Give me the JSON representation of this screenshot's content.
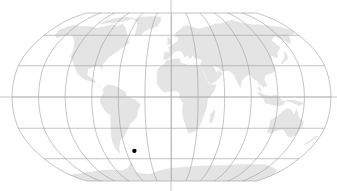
{
  "map": {
    "projection": "Robinson",
    "width": 337,
    "height": 191,
    "center": {
      "x": 171.5,
      "y": 97
    },
    "equator_half_width": 159.5,
    "pole_half_height": 84,
    "graticule": {
      "lon_step_deg": 30,
      "lat_step_deg": 30
    },
    "colors": {
      "background": "#ffffff",
      "land": "#e4e4e4",
      "graticule": "#9a9a9a",
      "axis": "#b8b8b8",
      "marker": "#000000"
    },
    "crosshair": {
      "vertical_x": 171,
      "horizontal_y": 97
    },
    "markers": [
      {
        "name": "location-marker",
        "lon": -49,
        "lat": -52,
        "radius": 2.2
      }
    ]
  },
  "land": [
    {
      "name": "north-america",
      "coords": [
        [
          -168,
          66
        ],
        [
          -162,
          70
        ],
        [
          -156,
          71
        ],
        [
          -140,
          70
        ],
        [
          -128,
          70
        ],
        [
          -115,
          68
        ],
        [
          -95,
          72
        ],
        [
          -85,
          70
        ],
        [
          -80,
          73
        ],
        [
          -70,
          68
        ],
        [
          -62,
          60
        ],
        [
          -56,
          52
        ],
        [
          -66,
          45
        ],
        [
          -70,
          42
        ],
        [
          -76,
          38
        ],
        [
          -81,
          31
        ],
        [
          -81,
          25
        ],
        [
          -84,
          30
        ],
        [
          -90,
          29
        ],
        [
          -97,
          27
        ],
        [
          -97,
          21
        ],
        [
          -92,
          18
        ],
        [
          -88,
          16
        ],
        [
          -83,
          10
        ],
        [
          -78,
          8
        ],
        [
          -80,
          9
        ],
        [
          -86,
          13
        ],
        [
          -92,
          15
        ],
        [
          -98,
          16
        ],
        [
          -105,
          20
        ],
        [
          -110,
          24
        ],
        [
          -114,
          30
        ],
        [
          -118,
          34
        ],
        [
          -123,
          39
        ],
        [
          -124,
          46
        ],
        [
          -130,
          54
        ],
        [
          -140,
          60
        ],
        [
          -150,
          60
        ],
        [
          -158,
          57
        ],
        [
          -165,
          60
        ],
        [
          -168,
          66
        ]
      ]
    },
    {
      "name": "greenland",
      "coords": [
        [
          -52,
          60
        ],
        [
          -44,
          60
        ],
        [
          -38,
          65
        ],
        [
          -22,
          70
        ],
        [
          -18,
          76
        ],
        [
          -20,
          82
        ],
        [
          -35,
          83
        ],
        [
          -55,
          82
        ],
        [
          -68,
          78
        ],
        [
          -58,
          75
        ],
        [
          -54,
          70
        ],
        [
          -52,
          60
        ]
      ]
    },
    {
      "name": "arctic-islands",
      "coords": [
        [
          -120,
          72
        ],
        [
          -95,
          74
        ],
        [
          -80,
          76
        ],
        [
          -65,
          80
        ],
        [
          -85,
          82
        ],
        [
          -110,
          78
        ],
        [
          -120,
          72
        ]
      ]
    },
    {
      "name": "south-america",
      "coords": [
        [
          -78,
          8
        ],
        [
          -72,
          12
        ],
        [
          -62,
          10
        ],
        [
          -52,
          5
        ],
        [
          -50,
          0
        ],
        [
          -40,
          -3
        ],
        [
          -35,
          -7
        ],
        [
          -38,
          -13
        ],
        [
          -40,
          -20
        ],
        [
          -48,
          -26
        ],
        [
          -53,
          -33
        ],
        [
          -58,
          -38
        ],
        [
          -63,
          -41
        ],
        [
          -65,
          -45
        ],
        [
          -68,
          -50
        ],
        [
          -69,
          -55
        ],
        [
          -72,
          -52
        ],
        [
          -74,
          -45
        ],
        [
          -73,
          -37
        ],
        [
          -71,
          -28
        ],
        [
          -70,
          -18
        ],
        [
          -76,
          -13
        ],
        [
          -81,
          -5
        ],
        [
          -80,
          0
        ],
        [
          -77,
          4
        ],
        [
          -78,
          8
        ]
      ]
    },
    {
      "name": "europe-asia",
      "coords": [
        [
          -10,
          36
        ],
        [
          -9,
          43
        ],
        [
          -2,
          44
        ],
        [
          -4,
          48
        ],
        [
          2,
          51
        ],
        [
          8,
          54
        ],
        [
          10,
          58
        ],
        [
          5,
          62
        ],
        [
          14,
          67
        ],
        [
          22,
          70
        ],
        [
          30,
          70
        ],
        [
          40,
          67
        ],
        [
          45,
          68
        ],
        [
          60,
          70
        ],
        [
          70,
          73
        ],
        [
          80,
          73
        ],
        [
          90,
          75
        ],
        [
          105,
          78
        ],
        [
          115,
          74
        ],
        [
          130,
          72
        ],
        [
          140,
          72
        ],
        [
          160,
          70
        ],
        [
          170,
          69
        ],
        [
          180,
          66
        ],
        [
          178,
          62
        ],
        [
          165,
          60
        ],
        [
          162,
          56
        ],
        [
          156,
          51
        ],
        [
          145,
          59
        ],
        [
          135,
          55
        ],
        [
          140,
          48
        ],
        [
          132,
          43
        ],
        [
          128,
          37
        ],
        [
          122,
          40
        ],
        [
          120,
          32
        ],
        [
          122,
          28
        ],
        [
          117,
          23
        ],
        [
          108,
          21
        ],
        [
          106,
          16
        ],
        [
          109,
          11
        ],
        [
          104,
          9
        ],
        [
          100,
          13
        ],
        [
          98,
          8
        ],
        [
          103,
          2
        ],
        [
          98,
          15
        ],
        [
          94,
          17
        ],
        [
          90,
          22
        ],
        [
          86,
          20
        ],
        [
          80,
          15
        ],
        [
          78,
          8
        ],
        [
          73,
          18
        ],
        [
          72,
          21
        ],
        [
          67,
          25
        ],
        [
          58,
          25
        ],
        [
          56,
          27
        ],
        [
          50,
          30
        ],
        [
          48,
          29
        ],
        [
          52,
          24
        ],
        [
          56,
          26
        ],
        [
          59,
          22
        ],
        [
          52,
          16
        ],
        [
          44,
          12
        ],
        [
          43,
          17
        ],
        [
          38,
          24
        ],
        [
          35,
          28
        ],
        [
          34,
          31
        ],
        [
          36,
          36
        ],
        [
          28,
          37
        ],
        [
          26,
          40
        ],
        [
          24,
          38
        ],
        [
          22,
          36
        ],
        [
          20,
          40
        ],
        [
          16,
          38
        ],
        [
          12,
          44
        ],
        [
          8,
          44
        ],
        [
          3,
          43
        ],
        [
          0,
          39
        ],
        [
          -5,
          36
        ],
        [
          -10,
          36
        ]
      ]
    },
    {
      "name": "scandinavia",
      "coords": [
        [
          5,
          58
        ],
        [
          6,
          62
        ],
        [
          12,
          66
        ],
        [
          18,
          70
        ],
        [
          26,
          71
        ],
        [
          30,
          70
        ],
        [
          28,
          66
        ],
        [
          22,
          64
        ],
        [
          18,
          60
        ],
        [
          12,
          56
        ],
        [
          8,
          58
        ],
        [
          5,
          58
        ]
      ]
    },
    {
      "name": "africa",
      "coords": [
        [
          -17,
          21
        ],
        [
          -16,
          27
        ],
        [
          -10,
          31
        ],
        [
          -6,
          35
        ],
        [
          3,
          37
        ],
        [
          10,
          37
        ],
        [
          11,
          33
        ],
        [
          20,
          31
        ],
        [
          30,
          31
        ],
        [
          33,
          31
        ],
        [
          35,
          28
        ],
        [
          39,
          20
        ],
        [
          43,
          12
        ],
        [
          51,
          12
        ],
        [
          48,
          5
        ],
        [
          41,
          -2
        ],
        [
          40,
          -10
        ],
        [
          37,
          -18
        ],
        [
          35,
          -24
        ],
        [
          32,
          -29
        ],
        [
          28,
          -33
        ],
        [
          20,
          -35
        ],
        [
          18,
          -31
        ],
        [
          14,
          -22
        ],
        [
          12,
          -14
        ],
        [
          13,
          -6
        ],
        [
          9,
          -1
        ],
        [
          9,
          4
        ],
        [
          4,
          6
        ],
        [
          -4,
          5
        ],
        [
          -8,
          4
        ],
        [
          -13,
          8
        ],
        [
          -17,
          13
        ],
        [
          -17,
          21
        ]
      ]
    },
    {
      "name": "madagascar",
      "coords": [
        [
          44,
          -25
        ],
        [
          47,
          -25
        ],
        [
          50,
          -15
        ],
        [
          49,
          -12
        ],
        [
          44,
          -17
        ],
        [
          44,
          -25
        ]
      ]
    },
    {
      "name": "arabia",
      "coords": [
        [
          36,
          28
        ],
        [
          39,
          21
        ],
        [
          43,
          13
        ],
        [
          50,
          15
        ],
        [
          56,
          20
        ],
        [
          58,
          23
        ],
        [
          52,
          24
        ],
        [
          50,
          28
        ],
        [
          48,
          30
        ],
        [
          40,
          32
        ],
        [
          36,
          28
        ]
      ]
    },
    {
      "name": "british-isles",
      "coords": [
        [
          -6,
          50
        ],
        [
          1,
          51
        ],
        [
          0,
          54
        ],
        [
          -3,
          58
        ],
        [
          -6,
          58
        ],
        [
          -5,
          54
        ],
        [
          -6,
          50
        ]
      ]
    },
    {
      "name": "japan",
      "coords": [
        [
          130,
          31
        ],
        [
          135,
          34
        ],
        [
          140,
          36
        ],
        [
          142,
          40
        ],
        [
          141,
          45
        ],
        [
          139,
          41
        ],
        [
          135,
          36
        ],
        [
          130,
          33
        ],
        [
          130,
          31
        ]
      ]
    },
    {
      "name": "indonesia",
      "coords": [
        [
          95,
          5
        ],
        [
          104,
          -2
        ],
        [
          106,
          -6
        ],
        [
          115,
          -8
        ],
        [
          120,
          -9
        ],
        [
          126,
          -8
        ],
        [
          130,
          -3
        ],
        [
          140,
          -3
        ],
        [
          150,
          -6
        ],
        [
          145,
          -9
        ],
        [
          135,
          -5
        ],
        [
          125,
          -3
        ],
        [
          118,
          2
        ],
        [
          110,
          1
        ],
        [
          103,
          3
        ],
        [
          98,
          4
        ],
        [
          95,
          5
        ]
      ]
    },
    {
      "name": "australia",
      "coords": [
        [
          114,
          -22
        ],
        [
          114,
          -34
        ],
        [
          118,
          -35
        ],
        [
          124,
          -33
        ],
        [
          131,
          -31
        ],
        [
          137,
          -35
        ],
        [
          141,
          -38
        ],
        [
          147,
          -39
        ],
        [
          151,
          -34
        ],
        [
          153,
          -28
        ],
        [
          153,
          -24
        ],
        [
          146,
          -19
        ],
        [
          142,
          -11
        ],
        [
          140,
          -17
        ],
        [
          136,
          -12
        ],
        [
          131,
          -11
        ],
        [
          126,
          -14
        ],
        [
          122,
          -18
        ],
        [
          114,
          -22
        ]
      ]
    },
    {
      "name": "new-zealand",
      "coords": [
        [
          167,
          -46
        ],
        [
          172,
          -41
        ],
        [
          175,
          -37
        ],
        [
          178,
          -38
        ],
        [
          174,
          -42
        ],
        [
          170,
          -46
        ],
        [
          167,
          -46
        ]
      ]
    },
    {
      "name": "antarctica",
      "coords": [
        [
          -180,
          -90
        ],
        [
          -180,
          -78
        ],
        [
          -160,
          -77
        ],
        [
          -140,
          -75
        ],
        [
          -120,
          -73
        ],
        [
          -100,
          -72
        ],
        [
          -80,
          -73
        ],
        [
          -68,
          -70
        ],
        [
          -60,
          -64
        ],
        [
          -58,
          -65
        ],
        [
          -62,
          -70
        ],
        [
          -60,
          -75
        ],
        [
          -40,
          -78
        ],
        [
          -20,
          -73
        ],
        [
          0,
          -70
        ],
        [
          20,
          -69
        ],
        [
          40,
          -68
        ],
        [
          60,
          -67
        ],
        [
          80,
          -67
        ],
        [
          100,
          -66
        ],
        [
          120,
          -66
        ],
        [
          140,
          -66
        ],
        [
          160,
          -70
        ],
        [
          170,
          -72
        ],
        [
          180,
          -78
        ],
        [
          180,
          -90
        ]
      ]
    }
  ]
}
